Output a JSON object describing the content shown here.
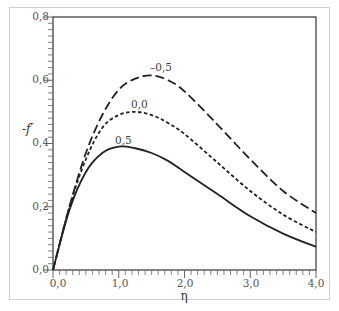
{
  "chart_data": {
    "type": "line",
    "title": "",
    "xlabel": "η",
    "ylabel": "-f′",
    "xlim": [
      0,
      4
    ],
    "ylim": [
      0,
      0.8
    ],
    "x_ticks": [
      "0,0",
      "1,0",
      "2,0",
      "3,0",
      "4,0"
    ],
    "y_ticks": [
      "0,0",
      "0,2",
      "0,4",
      "0,6",
      "0,8"
    ],
    "grid": false,
    "legend": "inline curve labels",
    "x": [
      0,
      0.25,
      0.5,
      0.75,
      1.0,
      1.25,
      1.5,
      1.75,
      2.0,
      2.5,
      3.0,
      3.5,
      4.0
    ],
    "series": [
      {
        "name": "-0,5",
        "style": "long-dash",
        "values": [
          0,
          0.2,
          0.37,
          0.49,
          0.57,
          0.605,
          0.615,
          0.6,
          0.565,
          0.46,
          0.35,
          0.25,
          0.18
        ]
      },
      {
        "name": "0,0",
        "style": "short-dash",
        "values": [
          0,
          0.2,
          0.35,
          0.45,
          0.49,
          0.5,
          0.49,
          0.465,
          0.43,
          0.34,
          0.25,
          0.175,
          0.12
        ]
      },
      {
        "name": "0,5",
        "style": "solid",
        "values": [
          0,
          0.19,
          0.31,
          0.37,
          0.39,
          0.385,
          0.37,
          0.345,
          0.31,
          0.24,
          0.17,
          0.115,
          0.073
        ]
      }
    ]
  },
  "labels": {
    "x_axis": "η",
    "y_axis": "-f′",
    "curve_neg05": "–0,5",
    "curve_00": "0,0",
    "curve_05": "0,5",
    "xt0": "0,0",
    "xt1": "1,0",
    "xt2": "2,0",
    "xt3": "3,0",
    "xt4": "4,0",
    "yt0": "0,0",
    "yt1": "0,2",
    "yt2": "0,4",
    "yt3": "0,6",
    "yt4": "0,8"
  }
}
